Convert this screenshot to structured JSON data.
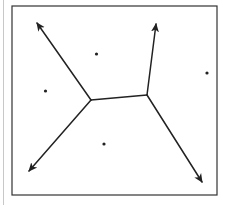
{
  "diagram": {
    "type": "voronoi",
    "colors": {
      "stroke": "#222222",
      "frame": "#333333",
      "background": "#ffffff",
      "side_rule": "#c8c8c8"
    },
    "frame": {
      "x": 12,
      "y": 6,
      "width": 205,
      "height": 189
    },
    "sites": [
      {
        "id": "site-top",
        "x": 96.5,
        "y": 54
      },
      {
        "id": "site-left",
        "x": 45.5,
        "y": 91
      },
      {
        "id": "site-right",
        "x": 207,
        "y": 73
      },
      {
        "id": "site-bottom",
        "x": 104,
        "y": 144
      }
    ],
    "vertices": [
      {
        "id": "v-left",
        "x": 91,
        "y": 100
      },
      {
        "id": "v-right",
        "x": 147,
        "y": 95
      }
    ],
    "edges": [
      {
        "id": "edge-middle",
        "from": [
          91,
          100
        ],
        "to": [
          147,
          95
        ],
        "arrow": false
      },
      {
        "id": "ray-top-left",
        "from": [
          91,
          100
        ],
        "to": [
          37,
          23
        ],
        "arrow": true
      },
      {
        "id": "ray-bottom-left",
        "from": [
          91,
          100
        ],
        "to": [
          29,
          171
        ],
        "arrow": true
      },
      {
        "id": "ray-top-right",
        "from": [
          147,
          95
        ],
        "to": [
          156,
          24
        ],
        "arrow": true
      },
      {
        "id": "ray-bottom-right",
        "from": [
          147,
          95
        ],
        "to": [
          202,
          182
        ],
        "arrow": true
      }
    ]
  }
}
